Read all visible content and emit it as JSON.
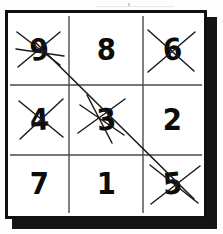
{
  "worksheet": {
    "title": "Number grid with crossed-out digits",
    "grid": {
      "rows": 3,
      "columns": 3,
      "cells": [
        {
          "row": 0,
          "col": 0,
          "value": "9",
          "crossed_out": true,
          "on_path": true
        },
        {
          "row": 0,
          "col": 1,
          "value": "8",
          "crossed_out": false,
          "on_path": false
        },
        {
          "row": 0,
          "col": 2,
          "value": "6",
          "crossed_out": true,
          "on_path": false
        },
        {
          "row": 1,
          "col": 0,
          "value": "4",
          "crossed_out": true,
          "on_path": false
        },
        {
          "row": 1,
          "col": 1,
          "value": "3",
          "crossed_out": true,
          "on_path": true
        },
        {
          "row": 1,
          "col": 2,
          "value": "2",
          "crossed_out": false,
          "on_path": false
        },
        {
          "row": 2,
          "col": 0,
          "value": "7",
          "crossed_out": false,
          "on_path": false
        },
        {
          "row": 2,
          "col": 1,
          "value": "1",
          "crossed_out": false,
          "on_path": false
        },
        {
          "row": 2,
          "col": 2,
          "value": "5",
          "crossed_out": true,
          "on_path": true
        }
      ]
    },
    "diagonal_line": {
      "description": "Straight line drawn from the 9 through the 3 to the 5",
      "sequence": [
        "9",
        "3",
        "5"
      ]
    },
    "colors": {
      "ink": "#0c0c0c",
      "paper": "#ffffff",
      "rule": "#4a4a4a",
      "border": "#101010",
      "shadow": "#141414"
    }
  }
}
